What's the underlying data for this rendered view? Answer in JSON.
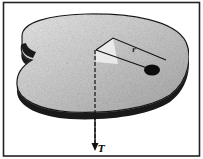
{
  "figure": {
    "labels": {
      "radius": "r",
      "axis_vector": "T"
    },
    "colors": {
      "frame": "#222222",
      "surface_light": "#d9d9d9",
      "surface_dark": "#9a9a9a",
      "edge": "#1a1a1a",
      "mass": "#0d0d0d",
      "background": "#ffffff"
    }
  }
}
